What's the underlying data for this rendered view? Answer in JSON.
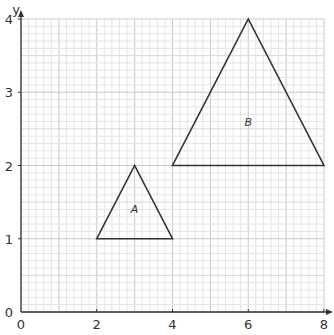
{
  "axes": {
    "x_label": "x",
    "y_label": "y",
    "x_ticks": [
      "0",
      "2",
      "4",
      "6",
      "8"
    ],
    "y_ticks": [
      "0",
      "1",
      "2",
      "3",
      "4"
    ]
  },
  "chart_data": {
    "type": "diagram",
    "title": "",
    "xlabel": "x",
    "ylabel": "y",
    "xlim": [
      0,
      8
    ],
    "ylim": [
      0,
      4
    ],
    "grid": true,
    "shapes": [
      {
        "name": "A",
        "type": "triangle",
        "vertices": [
          [
            2,
            1
          ],
          [
            4,
            1
          ],
          [
            3,
            2
          ]
        ],
        "label_pos": [
          3,
          1.4
        ]
      },
      {
        "name": "B",
        "type": "triangle",
        "vertices": [
          [
            4,
            2
          ],
          [
            8,
            2
          ],
          [
            6,
            4
          ]
        ],
        "label_pos": [
          6,
          2.6
        ]
      }
    ]
  },
  "shapes": {
    "a_label": "A",
    "b_label": "B"
  },
  "colors": {
    "grid_minor": "#e4e4e4",
    "grid_major": "#c8c8c8",
    "lines": "#333333"
  }
}
